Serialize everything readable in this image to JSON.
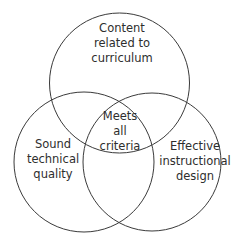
{
  "diagram": {
    "type": "venn",
    "stroke_color": "#3a3a3a",
    "text_color": "#2e2e2e",
    "background": "#ffffff",
    "sets": [
      {
        "id": "top",
        "lines": [
          "Content",
          "related to",
          "curriculum"
        ]
      },
      {
        "id": "left",
        "lines": [
          "Sound",
          "technical",
          "quality"
        ]
      },
      {
        "id": "right",
        "lines": [
          "Effective",
          "instructional",
          "design"
        ]
      }
    ],
    "intersection": {
      "lines": [
        "Meets",
        "all",
        "criteria"
      ]
    }
  }
}
